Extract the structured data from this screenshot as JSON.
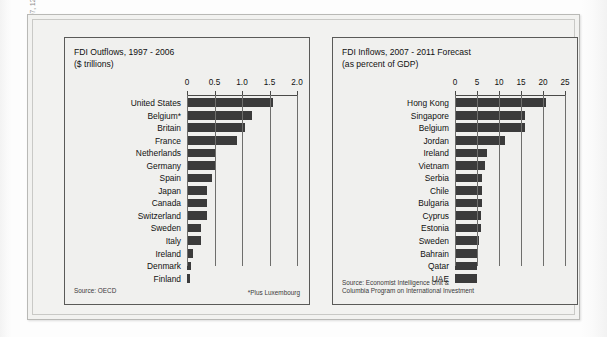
{
  "side_caption": {
    "text": "FDI outflows, Economist (June 30, 2007, 110); FDI inflow forecasts, Economist (September 15, 2007, 121)."
  },
  "chart_data": [
    {
      "type": "bar",
      "orientation": "horizontal",
      "panel_id": "left",
      "title": "FDI Outflows, 1997 - 2006",
      "subtitle": "($ trillions)",
      "xlabel": "",
      "ylabel": "",
      "xlim": [
        0,
        2.0
      ],
      "xticks": [
        0,
        0.5,
        1.0,
        1.5,
        2.0
      ],
      "xtick_labels": [
        "0",
        "0.5",
        "1.0",
        "1.5",
        "2.0"
      ],
      "grid": true,
      "legend": "none",
      "bar_color": "#3b3b3b",
      "categories": [
        "United States",
        "Belgium*",
        "Britain",
        "France",
        "Netherlands",
        "Germany",
        "Spain",
        "Japan",
        "Canada",
        "Switzerland",
        "Sweden",
        "Italy",
        "Ireland",
        "Denmark",
        "Finland"
      ],
      "values": [
        1.57,
        1.18,
        1.06,
        0.9,
        0.5,
        0.5,
        0.46,
        0.36,
        0.36,
        0.36,
        0.25,
        0.25,
        0.11,
        0.07,
        0.06
      ],
      "source": "Source: OECD",
      "footnote": "*Plus Luxembourg"
    },
    {
      "type": "bar",
      "orientation": "horizontal",
      "panel_id": "right",
      "title": "FDI Inflows, 2007 - 2011 Forecast",
      "subtitle": "(as percent of GDP)",
      "xlabel": "",
      "ylabel": "",
      "xlim": [
        0,
        25
      ],
      "xticks": [
        0,
        5,
        10,
        15,
        20,
        25
      ],
      "xtick_labels": [
        "0",
        "5",
        "10",
        "15",
        "20",
        "25"
      ],
      "grid": true,
      "legend": "none",
      "bar_color": "#3b3b3b",
      "categories": [
        "Hong Kong",
        "Singapore",
        "Belgium",
        "Jordan",
        "Ireland",
        "Vietnam",
        "Serbia",
        "Chile",
        "Bulgaria",
        "Cyprus",
        "Estonia",
        "Sweden",
        "Bahrain",
        "Qatar",
        "UAE"
      ],
      "values": [
        20.6,
        15.8,
        15.9,
        11.3,
        7.2,
        6.8,
        6.2,
        6.2,
        6.1,
        5.9,
        5.8,
        5.4,
        5.2,
        5.1,
        5.1
      ],
      "source_line1": "Source: Economist Intelligence Unit &",
      "source_line2": "Columbia Program on International Investment",
      "footnote": ""
    }
  ]
}
